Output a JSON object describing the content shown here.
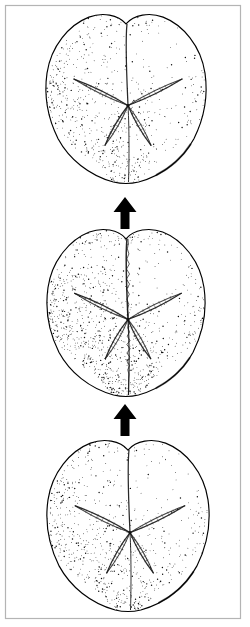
{
  "figure": {
    "title": "Heart urchin aboral-view series",
    "description": "Three stippled line drawings of spatangoid echinoid tests (heart urchins) seen from above, stacked vertically and linked by upward arrows indicating a bottom-to-top sequence.",
    "background_color": "#ffffff",
    "ink_color": "#000000",
    "border_color": "#b4b4b4",
    "canvas": {
      "width": 250,
      "height": 627
    },
    "border_box": {
      "x": 5.5,
      "y": 5.5,
      "width": 235,
      "height": 613
    },
    "reading_direction": "bottom-to-top",
    "caption": ""
  },
  "specimens": [
    {
      "id": "specimen-top",
      "label": "Top specimen",
      "position": "top",
      "order": 3,
      "center": {
        "x": 126,
        "y": 97
      },
      "width": 158,
      "height": 170,
      "view": "aboral",
      "outline_shape": "heart",
      "apical_notch": true,
      "petal_count": 5,
      "anterior_groove": "shallow",
      "stipple_density": 0.58,
      "shading_bias": "left",
      "seed": 1301
    },
    {
      "id": "specimen-middle",
      "label": "Middle specimen",
      "position": "middle",
      "order": 2,
      "center": {
        "x": 126,
        "y": 311
      },
      "width": 156,
      "height": 168,
      "view": "aboral",
      "outline_shape": "heart",
      "apical_notch": true,
      "petal_count": 5,
      "anterior_groove": "deep",
      "stipple_density": 0.82,
      "shading_bias": "left",
      "seed": 2207
    },
    {
      "id": "specimen-bottom",
      "label": "Bottom specimen",
      "position": "bottom",
      "order": 1,
      "center": {
        "x": 128,
        "y": 524
      },
      "width": 160,
      "height": 172,
      "view": "aboral",
      "outline_shape": "heart",
      "apical_notch": true,
      "petal_count": 5,
      "anterior_groove": "shallow",
      "stipple_density": 0.62,
      "shading_bias": "left",
      "seed": 3119
    }
  ],
  "arrows": [
    {
      "id": "arrow-lower",
      "label": "Arrow from bottom specimen to middle specimen",
      "direction": "up",
      "from": "specimen-bottom",
      "to": "specimen-middle",
      "x": 125,
      "top_y": 404,
      "bottom_y": 436,
      "shaft_width": 9,
      "head_width": 23,
      "head_height": 15,
      "color": "#000000"
    },
    {
      "id": "arrow-upper",
      "label": "Arrow from middle specimen to top specimen",
      "direction": "up",
      "from": "specimen-middle",
      "to": "specimen-top",
      "x": 125,
      "top_y": 197,
      "bottom_y": 229,
      "shaft_width": 9,
      "head_width": 23,
      "head_height": 15,
      "color": "#000000"
    }
  ],
  "icons": {
    "arrow_up": "arrow-up-icon"
  }
}
